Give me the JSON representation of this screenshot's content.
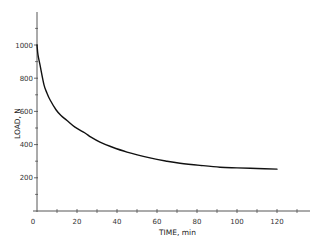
{
  "chart_data": {
    "type": "line",
    "title": "",
    "xlabel": "TIME, min",
    "ylabel": "LOAD, N",
    "xlim": [
      0,
      135
    ],
    "ylim": [
      0,
      1200
    ],
    "x_ticks": [
      0,
      20,
      40,
      60,
      80,
      100,
      120
    ],
    "x_tick_labels": [
      "0",
      "20",
      "40",
      "60",
      "80",
      "100",
      "120"
    ],
    "x_minor_ticks": [
      10,
      30,
      50,
      70,
      90,
      110,
      130
    ],
    "y_ticks": [
      200,
      400,
      600,
      800,
      1000
    ],
    "y_tick_labels": [
      "200",
      "400",
      "600",
      "800",
      "1000"
    ],
    "y_minor_ticks": [
      100,
      300,
      500,
      700,
      900,
      1100
    ],
    "grid": false,
    "legend": null,
    "series": [
      {
        "name": "Load relaxation",
        "color": "#111111",
        "x": [
          0,
          0.5,
          1.5,
          3.5,
          5,
          6.5,
          9.5,
          12,
          15,
          19,
          24,
          27,
          31.5,
          36.5,
          45,
          56.5,
          65,
          71.5,
          81.5,
          91.5,
          100,
          110,
          120
        ],
        "y": [
          1000,
          940,
          880,
          760,
          710,
          670,
          610,
          575,
          545,
          505,
          470,
          445,
          415,
          390,
          355,
          320,
          300,
          288,
          275,
          264,
          260,
          256,
          252
        ]
      }
    ]
  },
  "axes": {
    "x_title": "TIME, min",
    "y_title": "LOAD, N"
  }
}
